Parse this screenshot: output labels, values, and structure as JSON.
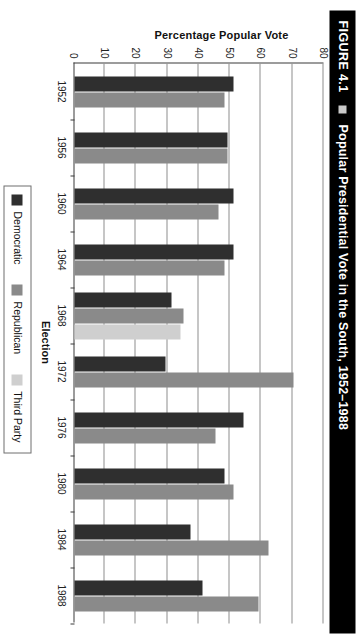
{
  "figure": {
    "number": "FIGURE 4.1",
    "marker_icon": "square-bullet-icon",
    "title": "Popular Presidential Vote in the South, 1952–1988"
  },
  "axes": {
    "y_title": "Percentage Popular Vote",
    "x_title": "Election",
    "y_ticks": [
      "80",
      "70",
      "60",
      "50",
      "40",
      "30",
      "20",
      "10",
      "0"
    ],
    "y_min": 0,
    "y_max": 80,
    "grid": true
  },
  "legend": {
    "position": "bottom",
    "items": [
      {
        "label": "Democratic",
        "color": "#2f2f2f"
      },
      {
        "label": "Republican",
        "color": "#8a8a8a"
      },
      {
        "label": "Third Party",
        "color": "#cfcfcf"
      }
    ]
  },
  "chart_data": {
    "type": "bar",
    "title": "Popular Presidential Vote in the South, 1952–1988",
    "xlabel": "Election",
    "ylabel": "Percentage Popular Vote",
    "ylim": [
      0,
      80
    ],
    "grid": true,
    "orientation": "vertical",
    "categories": [
      "1952",
      "1956",
      "1960",
      "1964",
      "1968",
      "1972",
      "1976",
      "1980",
      "1984",
      "1988"
    ],
    "series": [
      {
        "name": "Democratic",
        "color": "#2f2f2f",
        "values": [
          51,
          49,
          51,
          51,
          31,
          29,
          54,
          48,
          37,
          41
        ]
      },
      {
        "name": "Republican",
        "color": "#8a8a8a",
        "values": [
          48,
          49,
          46,
          48,
          35,
          70,
          45,
          51,
          62,
          59
        ]
      },
      {
        "name": "Third Party",
        "color": "#cfcfcf",
        "values": [
          0,
          0,
          0,
          0,
          34,
          0,
          0,
          0,
          0,
          0
        ]
      }
    ]
  }
}
